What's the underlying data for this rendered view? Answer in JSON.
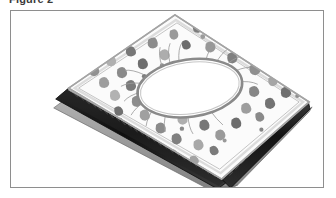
{
  "caption": {
    "label": "Figure 2"
  },
  "frame": {
    "name": "figure-border",
    "border_color": "#8e8e8e",
    "background_color": "#ffffff"
  },
  "illustration": {
    "title": "perspective view of layered slab with central oval aperture",
    "style": "grayscale pen-and-ink technical drawing",
    "alt_text": "Angled perspective drawing of a flat rectangular multi-layer panel. The speckled upper surface is covered with irregular dark gray blobs and has a large oval opening near its center ringed by fine radiating hair-like lines. The near left and bottom edges reveal a stack of thin layers: a pale top sheet, a dark middle core and a gray base plate.",
    "colors": {
      "paper": "#ffffff",
      "top_surface_fill": "#fbfbfb",
      "top_surface_outline": "#a9a9a9",
      "speckle_dark": "#6f6f6f",
      "speckle_mid": "#8f8f8f",
      "speckle_light": "#b9b9b9",
      "oval_outline": "#8a8a8a",
      "oval_fill": "#ffffff",
      "hair_line": "#9a9a9a",
      "layer_core_dark": "#1b1b1b",
      "layer_core_mid": "#4a4a4a",
      "layer_base_gray": "#9c9c9c",
      "layer_edge_light": "#d8d8d8",
      "serration": "#5a5a5a"
    },
    "parts": [
      {
        "name": "top-speckled-surface",
        "description": "pale quadrilateral face dotted with irregular gray blobs"
      },
      {
        "name": "central-oval-aperture",
        "description": "large white oval hole at the middle of the top face"
      },
      {
        "name": "radiating-fibers",
        "description": "fine hair-like lines fanning outward from the oval rim"
      },
      {
        "name": "left-layer-stack",
        "description": "dark banded edge showing stacked layers along the near-left side"
      },
      {
        "name": "bottom-layer-stack",
        "description": "dark banded edge showing stacked layers along the near-bottom side"
      },
      {
        "name": "base-plate",
        "description": "lowest gray slab extending slightly beyond the upper layers"
      }
    ],
    "geometry": {
      "top_face_polygon": "165,4 300,92 212,170 58,78",
      "oval_center": [
        180,
        78
      ],
      "oval_radii": [
        53,
        29
      ],
      "oval_rotation_deg": -8
    }
  }
}
